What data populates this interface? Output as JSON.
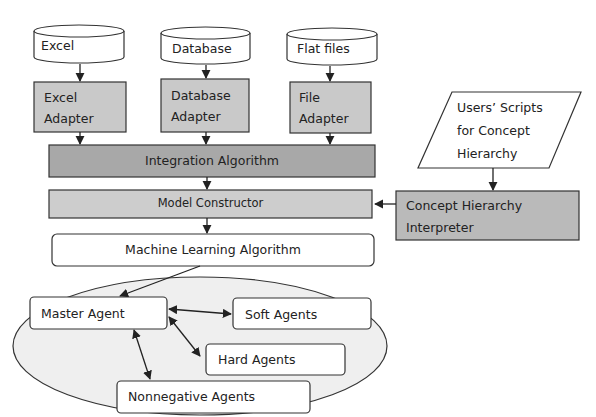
{
  "diagram": {
    "sources": [
      {
        "id": "excel",
        "label": "Excel"
      },
      {
        "id": "database",
        "label": "Database"
      },
      {
        "id": "flat_files",
        "label": "Flat files"
      }
    ],
    "adapters": [
      {
        "id": "excel_adapter",
        "line1": "Excel",
        "line2": "Adapter"
      },
      {
        "id": "database_adapter",
        "line1": "Database",
        "line2": "Adapter"
      },
      {
        "id": "file_adapter",
        "line1": "File",
        "line2": "Adapter"
      }
    ],
    "integration": {
      "label": "Integration Algorithm"
    },
    "model_constructor": {
      "label": "Model Constructor"
    },
    "ml_algorithm": {
      "label": "Machine Learning Algorithm"
    },
    "user_scripts": {
      "line1": "Users’ Scripts",
      "line2": "for Concept",
      "line3": "Hierarchy"
    },
    "interpreter": {
      "line1": "Concept Hierarchy",
      "line2": "Interpreter"
    },
    "agents": {
      "master": "Master Agent",
      "soft": "Soft Agents",
      "hard": "Hard Agents",
      "nonnegative": "Nonnegative Agents"
    },
    "colors": {
      "adapter_fill": "#c9c9c9",
      "integration_fill": "#a8a8a8",
      "model_fill": "#cdcdcd",
      "interpreter_fill": "#bababa",
      "ellipse_fill": "#efefef",
      "stroke": "#333333"
    }
  }
}
